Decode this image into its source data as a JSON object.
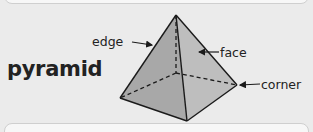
{
  "diagram": {
    "title": "pyramid",
    "labels": {
      "edge": "edge",
      "face": "face",
      "corner": "corner"
    },
    "colors": {
      "background": "#ebebeb",
      "face_left": "#a9a9a9",
      "face_right": "#bdbdbd",
      "face_front": "#b3b3b3",
      "line": "#1a1a1a"
    }
  }
}
